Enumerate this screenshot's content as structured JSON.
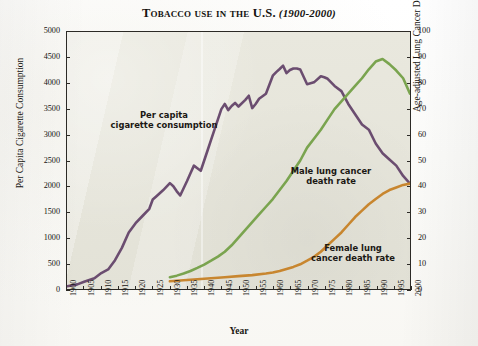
{
  "title": {
    "main": "Tobacco use in the U.S.",
    "range": "(1900-2000)"
  },
  "axes": {
    "y_left_title": "Per Capita Cigarette Consumption",
    "y_right_title": "Age-adjusted Lung Cancer Death Rates*",
    "x_title": "Year",
    "y_left_ticks": [
      "0",
      "500",
      "1000",
      "1500",
      "2000",
      "2500",
      "3000",
      "3500",
      "4000",
      "4500",
      "5000"
    ],
    "y_right_ticks": [
      "0",
      "10",
      "20",
      "30",
      "40",
      "50",
      "60",
      "70",
      "80",
      "90",
      "100"
    ],
    "x_ticks": [
      "1900",
      "1905",
      "1910",
      "1915",
      "1920",
      "1925",
      "1930",
      "1935",
      "1940",
      "1945",
      "1950",
      "1955",
      "1960",
      "1965",
      "1970",
      "1975",
      "1980",
      "1985",
      "1990",
      "1995",
      "2000"
    ]
  },
  "annotations": {
    "consumption": "Per capita\ncigarette consumption",
    "male": "Male lung cancer\ndeath rate",
    "female": "Female lung\ncancer death rate"
  },
  "colors": {
    "consumption": "#6b4d70",
    "male": "#7aa44f",
    "female": "#c8862f",
    "plot_background": "#e7e6dc",
    "frame": "#2c2a26"
  },
  "chart_data": {
    "type": "line",
    "title": "Tobacco use in the U.S. (1900-2000)",
    "xlabel": "Year",
    "ylabel": "Per Capita Cigarette Consumption",
    "y2label": "Age-adjusted Lung Cancer Death Rates*",
    "xlim": [
      1900,
      2000
    ],
    "ylim": [
      0,
      5000
    ],
    "y2lim": [
      0,
      100
    ],
    "grid": false,
    "legend": "annotations-inline",
    "series": [
      {
        "name": "Per capita cigarette consumption",
        "axis": "left",
        "color": "#6b4d70",
        "x": [
          1900,
          1903,
          1905,
          1908,
          1910,
          1912,
          1914,
          1916,
          1918,
          1920,
          1922,
          1924,
          1925,
          1926,
          1928,
          1930,
          1931,
          1932,
          1933,
          1934,
          1935,
          1936,
          1937,
          1938,
          1939,
          1940,
          1941,
          1942,
          1943,
          1944,
          1945,
          1946,
          1947,
          1948,
          1949,
          1950,
          1952,
          1953,
          1954,
          1955,
          1956,
          1958,
          1960,
          1961,
          1962,
          1963,
          1964,
          1965,
          1966,
          1967,
          1968,
          1970,
          1972,
          1974,
          1975,
          1976,
          1978,
          1980,
          1982,
          1984,
          1986,
          1988,
          1990,
          1992,
          1994,
          1996,
          1998,
          2000
        ],
        "y": [
          54,
          90,
          140,
          210,
          310,
          380,
          560,
          800,
          1100,
          1280,
          1420,
          1560,
          1740,
          1800,
          1920,
          2060,
          2000,
          1900,
          1820,
          1960,
          2100,
          2250,
          2400,
          2350,
          2300,
          2500,
          2700,
          2900,
          3100,
          3300,
          3500,
          3600,
          3480,
          3560,
          3620,
          3550,
          3680,
          3760,
          3520,
          3600,
          3700,
          3800,
          4150,
          4220,
          4280,
          4345,
          4200,
          4260,
          4290,
          4290,
          4270,
          3985,
          4020,
          4140,
          4120,
          4090,
          3950,
          3850,
          3600,
          3400,
          3200,
          3100,
          2830,
          2640,
          2520,
          2400,
          2200,
          2050
        ]
      },
      {
        "name": "Male lung cancer death rate",
        "axis": "right",
        "color": "#7aa44f",
        "x": [
          1930,
          1932,
          1934,
          1936,
          1938,
          1940,
          1942,
          1944,
          1946,
          1948,
          1950,
          1952,
          1954,
          1956,
          1958,
          1960,
          1962,
          1964,
          1966,
          1968,
          1970,
          1972,
          1974,
          1976,
          1978,
          1980,
          1982,
          1984,
          1986,
          1988,
          1990,
          1992,
          1994,
          1996,
          1998,
          2000
        ],
        "y": [
          4.6,
          5.2,
          6.0,
          7.0,
          8.2,
          9.5,
          11.0,
          12.6,
          14.5,
          17.0,
          20.0,
          23.0,
          26.0,
          29.0,
          32.0,
          35.0,
          38.5,
          42.0,
          46.0,
          50.0,
          55.0,
          58.5,
          62.0,
          66.0,
          70.0,
          73.0,
          76.0,
          79.0,
          82.0,
          85.5,
          88.5,
          89.5,
          87.5,
          85.0,
          82.0,
          76.0
        ]
      },
      {
        "name": "Female lung cancer death rate",
        "axis": "right",
        "color": "#c8862f",
        "x": [
          1930,
          1934,
          1938,
          1942,
          1946,
          1950,
          1954,
          1958,
          1960,
          1962,
          1964,
          1966,
          1968,
          1970,
          1972,
          1974,
          1976,
          1978,
          1980,
          1982,
          1984,
          1986,
          1988,
          1990,
          1992,
          1994,
          1996,
          1998,
          2000
        ],
        "y": [
          3.0,
          3.4,
          3.8,
          4.2,
          4.6,
          5.0,
          5.4,
          6.0,
          6.4,
          7.0,
          7.8,
          8.6,
          9.6,
          11.0,
          12.5,
          14.5,
          17.0,
          19.5,
          22.0,
          25.0,
          28.0,
          30.5,
          33.0,
          35.0,
          37.0,
          38.5,
          39.5,
          40.5,
          41.0
        ]
      }
    ]
  }
}
